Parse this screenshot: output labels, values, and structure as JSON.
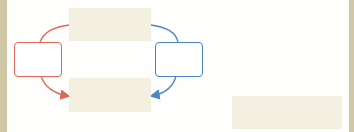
{
  "diagram": {
    "colors": {
      "frame": "#cfc7a6",
      "filled_node": "#f3f0e1",
      "left_path": "#e0675a",
      "right_path": "#4a86c5"
    },
    "nodes": [
      {
        "id": "top",
        "label": "",
        "style": "filled"
      },
      {
        "id": "left",
        "label": "",
        "style": "outlined-red"
      },
      {
        "id": "right",
        "label": "",
        "style": "outlined-blue"
      },
      {
        "id": "bottom",
        "label": "",
        "style": "filled"
      },
      {
        "id": "aside",
        "label": "",
        "style": "filled"
      }
    ],
    "edges": [
      {
        "from": "top",
        "to": "left",
        "color": "red",
        "arrow": false
      },
      {
        "from": "left",
        "to": "bottom",
        "color": "red",
        "arrow": true
      },
      {
        "from": "top",
        "to": "right",
        "color": "blue",
        "arrow": false
      },
      {
        "from": "right",
        "to": "bottom",
        "color": "blue",
        "arrow": true
      }
    ]
  }
}
